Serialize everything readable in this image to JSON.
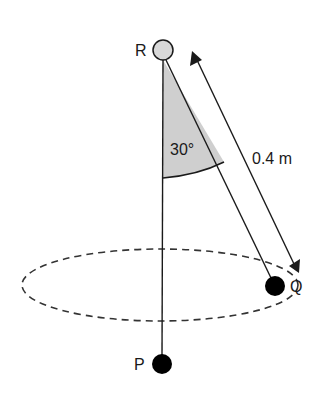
{
  "diagram": {
    "labels": {
      "pivot": "R",
      "bob_rest": "P",
      "bob_swing": "Q",
      "angle": "30°",
      "length": "0.4 m"
    },
    "values": {
      "angle_deg": 30,
      "length_m": 0.4
    },
    "colors": {
      "ink": "#1a1a1a",
      "pivot_fill": "#d8d8d8",
      "sector_fill": "#cfcfcf",
      "bob_fill": "#000000"
    }
  }
}
